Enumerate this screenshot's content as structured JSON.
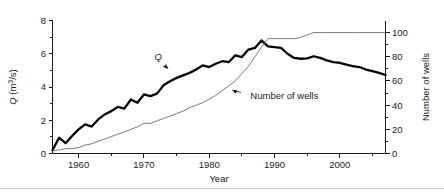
{
  "figure": {
    "background_color": "#ffffff",
    "q_color": "#000000",
    "wells_color": "#6b6b6b",
    "axis_color": "#1a1a1a"
  },
  "axes": {
    "x": {
      "title": "Year",
      "min": 1956,
      "max": 2007,
      "major_ticks": [
        1960,
        1970,
        1980,
        1990,
        2000
      ],
      "major_tick_labels": [
        "1960",
        "1970",
        "1980",
        "1990",
        "2000"
      ],
      "minor_ticks": [
        1965,
        1975,
        1985,
        1995,
        2005
      ]
    },
    "y_left": {
      "title": "Q (m3/s)",
      "title_parts": {
        "symbol": "Q",
        "unit_prefix": " (m",
        "unit_sup": "3",
        "unit_suffix": "/s)"
      },
      "min": 0,
      "max": 8,
      "major_ticks": [
        0,
        2,
        4,
        6,
        8
      ],
      "major_tick_labels": [
        "0",
        "2",
        "4",
        "6",
        "8"
      ],
      "minor_ticks": [
        1,
        3,
        5,
        7
      ]
    },
    "y_right": {
      "title": "Number of wells",
      "min": 0,
      "max": 110,
      "major_ticks": [
        0,
        20,
        40,
        60,
        80,
        100
      ],
      "major_tick_labels": [
        "0",
        "20",
        "40",
        "60",
        "80",
        "100"
      ],
      "minor_ticks": [
        10,
        30,
        50,
        70,
        90
      ]
    }
  },
  "annotations": [
    {
      "id": "q-annotation",
      "label": "Q",
      "italic": true,
      "text_x": 1972.2,
      "text_y_left": 5.62,
      "arrow_to_x": 1974.1,
      "arrow_to_y_left": 4.98
    },
    {
      "id": "wells-annotation",
      "label": "Number of wells",
      "italic": false,
      "text_x": 1986.3,
      "text_y_left": 3.3,
      "arrow_to_x": 1983.1,
      "arrow_to_y_left": 3.9
    }
  ],
  "chart_data": {
    "type": "line",
    "title": "",
    "xlabel": "Year",
    "ylabel": "Q (m3/s)",
    "ylabel_secondary": "Number of wells",
    "xlim": [
      1956,
      2007
    ],
    "ylim": [
      0,
      8
    ],
    "ylim_secondary": [
      0,
      110
    ],
    "grid": false,
    "legend": "none (curves labelled in-plot with leader arrows)",
    "series": [
      {
        "name": "Q",
        "axis": "left",
        "unit": "m3/s",
        "style": "thick black jagged line",
        "x": [
          1956,
          1957,
          1958,
          1959,
          1960,
          1961,
          1962,
          1963,
          1964,
          1965,
          1966,
          1967,
          1968,
          1969,
          1970,
          1971,
          1972,
          1973,
          1974,
          1975,
          1976,
          1977,
          1978,
          1979,
          1980,
          1981,
          1982,
          1983,
          1984,
          1985,
          1986,
          1987,
          1988,
          1989,
          1990,
          1991,
          1992,
          1993,
          1994,
          1995,
          1996,
          1997,
          1998,
          1999,
          2000,
          2001,
          2002,
          2003,
          2004,
          2005,
          2006,
          2007
        ],
        "values": [
          0.2,
          0.95,
          0.62,
          1.05,
          1.45,
          1.75,
          1.62,
          2.05,
          2.35,
          2.55,
          2.8,
          2.7,
          3.25,
          3.05,
          3.55,
          3.45,
          3.6,
          4.1,
          4.35,
          4.55,
          4.7,
          4.85,
          5.05,
          5.3,
          5.2,
          5.4,
          5.55,
          5.5,
          5.9,
          5.8,
          6.25,
          6.35,
          6.8,
          6.45,
          6.4,
          6.35,
          6.0,
          5.75,
          5.7,
          5.72,
          5.85,
          5.75,
          5.6,
          5.5,
          5.45,
          5.35,
          5.25,
          5.2,
          5.05,
          4.95,
          4.85,
          4.72
        ]
      },
      {
        "name": "Number of wells",
        "axis": "right",
        "unit": "wells",
        "style": "thin grey line",
        "x": [
          1956,
          1957,
          1958,
          1959,
          1960,
          1961,
          1962,
          1963,
          1964,
          1965,
          1966,
          1967,
          1968,
          1969,
          1970,
          1971,
          1972,
          1973,
          1974,
          1975,
          1976,
          1977,
          1978,
          1979,
          1980,
          1981,
          1982,
          1983,
          1984,
          1985,
          1986,
          1987,
          1988,
          1989,
          1990,
          1991,
          1992,
          1993,
          1994,
          1995,
          1996,
          1997,
          1998,
          1999,
          2000,
          2001,
          2002,
          2003,
          2004,
          2005,
          2006,
          2007
        ],
        "values": [
          2,
          3,
          4,
          4,
          5,
          7,
          8,
          10,
          12,
          14,
          16,
          18,
          20,
          22,
          25,
          25,
          27,
          29,
          31,
          33,
          35,
          38,
          40,
          42,
          45,
          48,
          52,
          56,
          60,
          66,
          72,
          80,
          88,
          95,
          95,
          95,
          95,
          95,
          96,
          98,
          100,
          100,
          100,
          100,
          100,
          100,
          100,
          100,
          100,
          100,
          100,
          100
        ]
      }
    ]
  }
}
